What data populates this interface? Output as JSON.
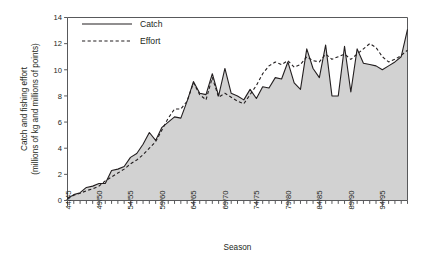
{
  "chart_data": {
    "type": "area",
    "title": "",
    "xlabel": "Season",
    "ylabel": "Catch and fishing effort (millions of kg and millions of points)",
    "ylabel_line1": "Catch and fishing effort",
    "ylabel_line2": "(millions of kg and millions of points)",
    "ylim": [
      0,
      14
    ],
    "yticks": [
      0,
      2,
      4,
      6,
      8,
      10,
      12,
      14
    ],
    "ytick_labels": [
      "0",
      "2",
      "4",
      "6",
      "8",
      "10",
      "12",
      "14"
    ],
    "grid": false,
    "legend_position": "top-left",
    "x": [
      "44/45",
      "45/46",
      "46/47",
      "47/48",
      "48/49",
      "49/50",
      "50/51",
      "51/52",
      "52/53",
      "53/54",
      "54/55",
      "55/56",
      "56/57",
      "57/58",
      "58/59",
      "59/60",
      "60/61",
      "61/62",
      "62/63",
      "63/64",
      "64/65",
      "65/66",
      "66/67",
      "67/68",
      "68/69",
      "69/70",
      "70/71",
      "71/72",
      "72/73",
      "73/74",
      "74/75",
      "75/76",
      "76/77",
      "77/78",
      "78/79",
      "79/80",
      "80/81",
      "81/82",
      "82/83",
      "83/84",
      "84/85",
      "85/86",
      "86/87",
      "87/88",
      "88/89",
      "89/90",
      "90/91",
      "91/92",
      "92/93",
      "93/94",
      "94/95",
      "95/96",
      "96/97",
      "97/98",
      "98/99"
    ],
    "xtick_labels": [
      "44/45",
      "49/50",
      "54/55",
      "59/60",
      "64/65",
      "69/70",
      "74/75",
      "79/80",
      "84/85",
      "89/90",
      "94/95"
    ],
    "xtick_indices": [
      0,
      5,
      10,
      15,
      20,
      25,
      30,
      35,
      40,
      45,
      50
    ],
    "series": [
      {
        "name": "Catch",
        "style": "solid",
        "filled": true,
        "fill_color": "#d2d2d2",
        "line_color": "#231f20",
        "values": [
          0.15,
          0.45,
          0.6,
          1.0,
          1.1,
          1.3,
          1.3,
          2.3,
          2.4,
          2.6,
          3.3,
          3.6,
          4.3,
          5.2,
          4.6,
          5.6,
          6.0,
          6.4,
          6.3,
          7.6,
          9.1,
          8.2,
          8.1,
          9.7,
          8.0,
          10.1,
          8.2,
          8.0,
          7.7,
          8.5,
          7.8,
          8.7,
          8.6,
          9.4,
          9.3,
          10.6,
          9.0,
          8.5,
          11.6,
          10.1,
          9.4,
          11.9,
          8.0,
          8.0,
          11.8,
          8.3,
          11.6,
          10.5,
          10.4,
          10.3,
          10.0,
          10.3,
          10.6,
          11.0,
          13.1
        ]
      },
      {
        "name": "Effort",
        "style": "dashed",
        "filled": false,
        "line_color": "#231f20",
        "values": [
          0.15,
          0.4,
          0.55,
          0.75,
          0.9,
          1.1,
          1.5,
          1.8,
          2.1,
          2.4,
          2.8,
          3.1,
          3.5,
          4.0,
          4.5,
          5.4,
          6.3,
          7.0,
          7.0,
          7.6,
          9.0,
          8.1,
          7.7,
          9.4,
          7.9,
          8.2,
          7.9,
          7.6,
          7.4,
          8.1,
          8.8,
          9.7,
          10.3,
          10.6,
          10.4,
          10.7,
          10.2,
          10.4,
          11.0,
          10.7,
          10.6,
          11.2,
          10.8,
          11.0,
          11.2,
          10.8,
          11.2,
          11.6,
          12.0,
          11.7,
          11.0,
          10.6,
          10.8,
          11.1,
          11.5
        ]
      }
    ]
  },
  "legend": {
    "items": [
      {
        "label": "Catch",
        "style": "solid"
      },
      {
        "label": "Effort",
        "style": "dashed"
      }
    ]
  }
}
